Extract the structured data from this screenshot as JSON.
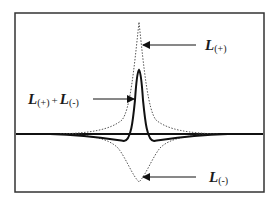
{
  "diagram": {
    "type": "line-shape schematic",
    "frame": {
      "x": 15,
      "y": 13,
      "width": 249,
      "height": 179,
      "stroke": "#333333"
    },
    "baseline_y": 134,
    "curves": [
      {
        "name": "L(+)",
        "style": "dotted",
        "color": "#555555",
        "peak": {
          "x": 139,
          "y": 22
        },
        "direction": "up"
      },
      {
        "name": "L(+) + L(-)",
        "style": "solid",
        "color": "#111111",
        "peak": {
          "x": 139,
          "y": 70
        },
        "direction": "up"
      },
      {
        "name": "L(-)",
        "style": "dotted",
        "color": "#555555",
        "peak": {
          "x": 139,
          "y": 182
        },
        "direction": "down"
      }
    ],
    "labels": {
      "plus": {
        "main": "L",
        "sub": "(+)"
      },
      "sum": {
        "main1": "L",
        "sub1": "(+)",
        "op": "+",
        "main2": "L",
        "sub2": "(-)"
      },
      "minus": {
        "main": "L",
        "sub": "(-)"
      }
    },
    "arrows": [
      {
        "target": "L(+)",
        "from": [
          196,
          45
        ],
        "to": [
          143,
          45
        ]
      },
      {
        "target": "L(+) + L(-)",
        "from": [
          93,
          99
        ],
        "to": [
          134,
          99
        ]
      },
      {
        "target": "L(-)",
        "from": [
          196,
          177
        ],
        "to": [
          143,
          177
        ]
      }
    ]
  }
}
